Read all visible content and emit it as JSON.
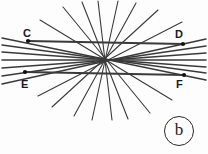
{
  "figure": {
    "panel_label": "b",
    "background_color": "#fdfdfd",
    "line_color": "#3a3a3a",
    "label_color": "#1a1a1a",
    "width": 208,
    "height": 154,
    "point_labels": {
      "C": "C",
      "D": "D",
      "E": "E",
      "F": "F"
    },
    "concurrency_point": {
      "x": 104,
      "y": 60
    },
    "marked_points": [
      {
        "name": "C",
        "x": 28,
        "y": 41
      },
      {
        "name": "D",
        "x": 183,
        "y": 44
      },
      {
        "name": "E",
        "x": 25,
        "y": 72
      },
      {
        "name": "F",
        "x": 184,
        "y": 75
      }
    ],
    "segments": [
      {
        "name": "segment-C-D",
        "x1": 28,
        "y1": 41,
        "x2": 183,
        "y2": 44,
        "weight": 1.9
      },
      {
        "name": "segment-E-F",
        "x1": 25,
        "y1": 72,
        "x2": 184,
        "y2": 75,
        "weight": 1.9
      }
    ],
    "lines": [
      {
        "name": "line-1",
        "x1": 2,
        "y1": 38,
        "x2": 206,
        "y2": 80,
        "weight": 1.5
      },
      {
        "name": "line-2",
        "x1": 2,
        "y1": 45,
        "x2": 206,
        "y2": 73,
        "weight": 1.5
      },
      {
        "name": "line-3",
        "x1": 2,
        "y1": 52,
        "x2": 206,
        "y2": 67,
        "weight": 1.5
      },
      {
        "name": "line-4",
        "x1": 2,
        "y1": 60,
        "x2": 206,
        "y2": 60,
        "weight": 1.6
      },
      {
        "name": "line-5",
        "x1": 2,
        "y1": 68,
        "x2": 206,
        "y2": 53,
        "weight": 1.5
      },
      {
        "name": "line-6",
        "x1": 2,
        "y1": 76,
        "x2": 206,
        "y2": 46,
        "weight": 1.5
      },
      {
        "name": "line-7",
        "x1": 2,
        "y1": 84,
        "x2": 206,
        "y2": 39,
        "weight": 1.5
      },
      {
        "name": "line-8",
        "x1": 40,
        "y1": 20,
        "x2": 172,
        "y2": 100,
        "weight": 1.1
      },
      {
        "name": "line-9",
        "x1": 63,
        "y1": 7,
        "x2": 150,
        "y2": 113,
        "weight": 1.1
      },
      {
        "name": "line-10",
        "x1": 82,
        "y1": 2,
        "x2": 128,
        "y2": 119,
        "weight": 1.1
      },
      {
        "name": "line-11",
        "x1": 98,
        "y1": 1,
        "x2": 112,
        "y2": 120,
        "weight": 1.1
      },
      {
        "name": "line-12",
        "x1": 118,
        "y1": 1,
        "x2": 92,
        "y2": 120,
        "weight": 1.1
      },
      {
        "name": "line-13",
        "x1": 136,
        "y1": 3,
        "x2": 74,
        "y2": 116,
        "weight": 1.1
      },
      {
        "name": "line-14",
        "x1": 158,
        "y1": 10,
        "x2": 52,
        "y2": 107,
        "weight": 1.1
      },
      {
        "name": "line-15",
        "x1": 182,
        "y1": 22,
        "x2": 38,
        "y2": 96,
        "weight": 1.1
      }
    ]
  }
}
